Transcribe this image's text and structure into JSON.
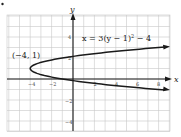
{
  "chart_data": {
    "type": "line",
    "title": "",
    "equation_label": "x = 3(y − 1)² − 4",
    "equation": {
      "a": 3,
      "h": -4,
      "k": 1,
      "form": "x = a(y - k)^2 + h"
    },
    "xlabel": "x",
    "ylabel": "y",
    "xlim": [
      -6,
      9
    ],
    "ylim": [
      -5,
      6
    ],
    "grid": true,
    "x_ticks": [
      {
        "value": -4,
        "label": "-4"
      },
      {
        "value": -2,
        "label": "-2"
      },
      {
        "value": 2,
        "label": "2"
      },
      {
        "value": 4,
        "label": "4"
      },
      {
        "value": 6,
        "label": "6"
      },
      {
        "value": 8,
        "label": "8"
      }
    ],
    "y_ticks": [
      {
        "value": 4,
        "label": "4"
      },
      {
        "value": 2,
        "label": "2"
      },
      {
        "value": -2,
        "label": "-2"
      },
      {
        "value": -4,
        "label": "-4"
      }
    ],
    "series": [
      {
        "name": "x = 3(y − 1)² − 4",
        "points": [
          {
            "x": 8.5,
            "y": 3.04
          },
          {
            "x": 5,
            "y": 2.73
          },
          {
            "x": 2,
            "y": 2.41
          },
          {
            "x": -1,
            "y": 2
          },
          {
            "x": -3.25,
            "y": 1.5
          },
          {
            "x": -4,
            "y": 1
          },
          {
            "x": -3.25,
            "y": 0.5
          },
          {
            "x": -1,
            "y": 0
          },
          {
            "x": 2,
            "y": -0.41
          },
          {
            "x": 5,
            "y": -0.73
          },
          {
            "x": 8.5,
            "y": -1.04
          }
        ]
      }
    ],
    "annotations": [
      {
        "text": "(-4, 1)",
        "x": -4,
        "y": 1,
        "type": "vertex"
      }
    ]
  },
  "labels": {
    "vertex": "(−4, 1)",
    "equation": "x = 3(y − 1)",
    "equation_exp": "2",
    "equation_tail": " − 4",
    "x_axis": "x",
    "y_axis": "y",
    "tick_x_m4": "−4",
    "tick_x_m2": "−2",
    "tick_x_2": "2",
    "tick_x_4": "4",
    "tick_x_6": "6",
    "tick_x_8": "8",
    "tick_y_4": "4",
    "tick_y_2": "2",
    "tick_y_m2": "−2",
    "tick_y_m4": "−4"
  }
}
